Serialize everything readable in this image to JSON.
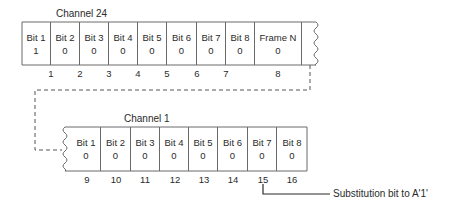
{
  "top_group": {
    "title": "Channel 24",
    "cells": [
      {
        "label": "Bit 1",
        "value": "1"
      },
      {
        "label": "Bit 2",
        "value": "0"
      },
      {
        "label": "Bit 3",
        "value": "0"
      },
      {
        "label": "Bit 4",
        "value": "0"
      },
      {
        "label": "Bit 5",
        "value": "0"
      },
      {
        "label": "Bit 6",
        "value": "0"
      },
      {
        "label": "Bit 7",
        "value": "0"
      },
      {
        "label": "Bit 8",
        "value": "0"
      },
      {
        "label": "Frame N",
        "value": "0"
      }
    ],
    "numbers": [
      "1",
      "2",
      "3",
      "4",
      "5",
      "6",
      "7",
      "8"
    ]
  },
  "bottom_group": {
    "title": "Channel 1",
    "cells": [
      {
        "label": "Bit 1",
        "value": "0"
      },
      {
        "label": "Bit 2",
        "value": "0"
      },
      {
        "label": "Bit 3",
        "value": "0"
      },
      {
        "label": "Bit 4",
        "value": "0"
      },
      {
        "label": "Bit 5",
        "value": "0"
      },
      {
        "label": "Bit 6",
        "value": "0"
      },
      {
        "label": "Bit 7",
        "value": "0"
      },
      {
        "label": "Bit 8",
        "value": "0"
      }
    ],
    "numbers": [
      "9",
      "10",
      "11",
      "12",
      "13",
      "14",
      "15",
      "16"
    ]
  },
  "annotation": {
    "text": "Substitution bit to A'1'"
  },
  "colors": {
    "line": "#6a6a6a",
    "text": "#2a2a2a"
  }
}
